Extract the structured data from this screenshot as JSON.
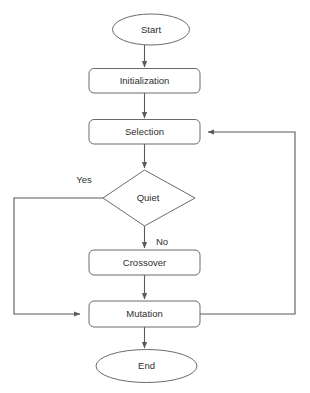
{
  "diagram": {
    "background_color": "#ffffff",
    "shape_stroke_color": "#6b6b6b",
    "connector_color": "#5a5a5a",
    "text_color": "#2e2e2e"
  },
  "nodes": [
    {
      "id": "start",
      "label": "Start",
      "shape": "ellipse"
    },
    {
      "id": "initialization",
      "label": "Initialization",
      "shape": "rounded-rectangle"
    },
    {
      "id": "selection",
      "label": "Selection",
      "shape": "rounded-rectangle"
    },
    {
      "id": "quiet",
      "label": "Quiet",
      "shape": "diamond"
    },
    {
      "id": "crossover",
      "label": "Crossover",
      "shape": "rounded-rectangle"
    },
    {
      "id": "mutation",
      "label": "Mutation",
      "shape": "rounded-rectangle"
    },
    {
      "id": "end",
      "label": "End",
      "shape": "ellipse"
    }
  ],
  "edge_labels": {
    "yes": "Yes",
    "no": "No"
  },
  "edges": [
    {
      "from": "start",
      "to": "initialization",
      "label": ""
    },
    {
      "from": "initialization",
      "to": "selection",
      "label": ""
    },
    {
      "from": "selection",
      "to": "quiet",
      "label": ""
    },
    {
      "from": "quiet",
      "to": "mutation",
      "label": "Yes"
    },
    {
      "from": "quiet",
      "to": "crossover",
      "label": "No"
    },
    {
      "from": "crossover",
      "to": "mutation",
      "label": ""
    },
    {
      "from": "mutation",
      "to": "end",
      "label": ""
    },
    {
      "from": "mutation",
      "to": "selection",
      "label": ""
    }
  ]
}
